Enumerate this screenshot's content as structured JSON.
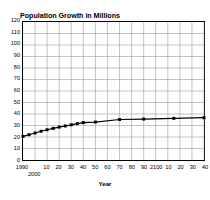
{
  "chart_data": {
    "type": "line",
    "title": "Population Growth in Millions",
    "xlabel": "Year",
    "ylabel": "",
    "ylim": [
      0,
      120
    ],
    "xlim": [
      1990,
      2140
    ],
    "grid": true,
    "legend": "none",
    "ytick_labels": [
      "120",
      "110",
      "100",
      "90",
      "80",
      "70",
      "60",
      "50",
      "40",
      "30",
      "20",
      "10",
      "0"
    ],
    "ytick_values": [
      120,
      110,
      100,
      90,
      80,
      70,
      60,
      50,
      40,
      30,
      20,
      10,
      0
    ],
    "xtick_labels": [
      "1990",
      "2000",
      "10",
      "20",
      "30",
      "40",
      "50",
      "60",
      "70",
      "80",
      "90",
      "2100",
      "10",
      "20",
      "30",
      "40"
    ],
    "xtick_values": [
      1990,
      2000,
      2010,
      2020,
      2030,
      2040,
      2050,
      2060,
      2070,
      2080,
      2090,
      2100,
      2110,
      2120,
      2130,
      2140
    ],
    "x": [
      1990,
      1995,
      2000,
      2005,
      2010,
      2015,
      2020,
      2025,
      2030,
      2035,
      2040,
      2050,
      2070,
      2090,
      2115,
      2140
    ],
    "values": [
      20.5,
      22.0,
      23.5,
      25.0,
      26.3,
      27.5,
      28.6,
      29.6,
      30.6,
      31.6,
      32.5,
      33.0,
      35.2,
      35.6,
      36.2,
      36.8
    ],
    "series": [
      {
        "name": "Population",
        "marker": "square",
        "color": "#000000",
        "x": [
          1990,
          1995,
          2000,
          2005,
          2010,
          2015,
          2020,
          2025,
          2030,
          2035,
          2040,
          2050,
          2070,
          2090,
          2115,
          2140
        ],
        "values": [
          20.5,
          22.0,
          23.5,
          25.0,
          26.3,
          27.5,
          28.6,
          29.6,
          30.6,
          31.6,
          32.5,
          33.0,
          35.2,
          35.6,
          36.2,
          36.8
        ]
      }
    ],
    "colors": {
      "line": "#000000",
      "marker": "#000000",
      "grid": "#9a9a9a",
      "axis": "#000000",
      "background": "#ffffff",
      "text": "#000000"
    }
  }
}
